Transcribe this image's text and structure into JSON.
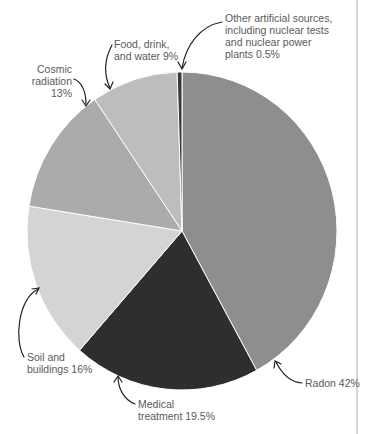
{
  "chart_data": {
    "type": "pie",
    "title": "",
    "start_angle_deg": 0,
    "direction": "clockwise",
    "slices": [
      {
        "label": "Radon",
        "value": 42,
        "color": "#8e8e8e",
        "display": "Radon 42%"
      },
      {
        "label": "Medical treatment",
        "value": 19.5,
        "color": "#2e2e2e",
        "display": "Medical\ntreatment 19.5%"
      },
      {
        "label": "Soil and buildings",
        "value": 16,
        "color": "#d4d4d4",
        "display": "Soil and\nbuildings 16%"
      },
      {
        "label": "Cosmic radiation",
        "value": 13,
        "color": "#ababab",
        "display": "Cosmic\nradiation 13%"
      },
      {
        "label": "Food, drink, and water",
        "value": 9,
        "color": "#bdbdbd",
        "display": "Food, drink,\nand water 9%"
      },
      {
        "label": "Other artificial sources, including nuclear tests and nuclear power plants",
        "value": 0.5,
        "color": "#3a3a3a",
        "display": "Other artificial sources,\nincluding nuclear tests\nand nuclear power\nplants 0.5%"
      }
    ],
    "units": "%",
    "legend": "none (direct labels with arrows)"
  },
  "labels": {
    "radon": "Radon 42%",
    "medical": "Medical\ntreatment 19.5%",
    "soil": "Soil and\nbuildings 16%",
    "cosmic": "Cosmic\nradiation 13%",
    "food": "Food, drink,\nand water 9%",
    "other": "Other artificial sources,\nincluding nuclear tests\nand nuclear power\nplants 0.5%"
  }
}
